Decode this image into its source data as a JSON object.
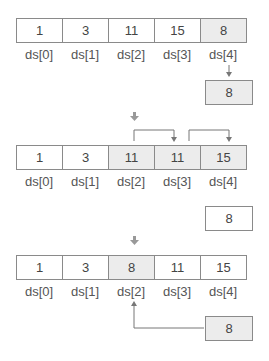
{
  "steps": [
    {
      "cells": [
        "1",
        "3",
        "11",
        "15",
        "8"
      ],
      "highlighted": [
        4
      ],
      "labels": [
        "ds[0]",
        "ds[1]",
        "ds[2]",
        "ds[3]",
        "ds[4]"
      ],
      "temp": "8",
      "temp_highlighted": true
    },
    {
      "cells": [
        "1",
        "3",
        "11",
        "11",
        "15"
      ],
      "highlighted": [
        2,
        3,
        4
      ],
      "labels": [
        "ds[0]",
        "ds[1]",
        "ds[2]",
        "ds[3]",
        "ds[4]"
      ],
      "temp": "8",
      "temp_highlighted": false
    },
    {
      "cells": [
        "1",
        "3",
        "8",
        "11",
        "15"
      ],
      "highlighted": [
        2
      ],
      "labels": [
        "ds[0]",
        "ds[1]",
        "ds[2]",
        "ds[3]",
        "ds[4]"
      ],
      "temp": "8",
      "temp_highlighted": true
    }
  ],
  "colors": {
    "border": "#8a8a8a",
    "highlight": "#ececec",
    "arrow": "#777777"
  }
}
